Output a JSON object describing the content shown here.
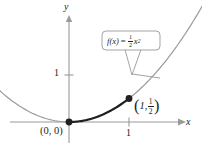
{
  "chart_data": {
    "type": "line",
    "title": "",
    "function_label": "f(x) = ½x²",
    "function_parts": {
      "name": "f",
      "arg": "(x)",
      "equals": "=",
      "coefficient_numerator": "1",
      "coefficient_denominator": "2",
      "variable": "x",
      "exponent": "2"
    },
    "xlabel": "x",
    "ylabel": "y",
    "grid": false,
    "legend": "none",
    "xlim": [
      -2.1,
      3.0
    ],
    "ylim": [
      -0.45,
      2.4
    ],
    "x_ticks": [
      1
    ],
    "x_tick_labels": [
      "1"
    ],
    "y_ticks": [
      1
    ],
    "y_tick_labels": [
      "1"
    ],
    "series": [
      {
        "name": "f(x) = 1/2 x^2 (light)",
        "color": "#9a9a9a",
        "style": "thin",
        "x": [
          -2.0,
          -1.75,
          -1.5,
          -1.25,
          -1.0,
          -0.75,
          -0.5,
          -0.25,
          0.0,
          0.25,
          0.5,
          0.75,
          1.0,
          1.25,
          1.5,
          1.75,
          2.0,
          2.15
        ],
        "y": [
          2.0,
          1.531,
          1.125,
          0.781,
          0.5,
          0.281,
          0.125,
          0.031,
          0.0,
          0.031,
          0.125,
          0.281,
          0.5,
          0.781,
          1.125,
          1.531,
          2.0,
          2.311
        ]
      },
      {
        "name": "highlighted arc 0 to 1 (bold)",
        "color": "#231f20",
        "style": "bold",
        "x": [
          0.0,
          0.2,
          0.4,
          0.6,
          0.8,
          1.0
        ],
        "y": [
          0.0,
          0.02,
          0.08,
          0.18,
          0.32,
          0.5
        ]
      }
    ],
    "points": [
      {
        "name": "origin",
        "x": 0,
        "y": 0,
        "label": "(0, 0)",
        "marker": "filled-circle"
      },
      {
        "name": "endpoint",
        "x": 1,
        "y": 0.5,
        "label": "(1, ½)",
        "marker": "filled-circle",
        "label_parts": {
          "open": "(",
          "x_value": "1",
          "comma": ",",
          "y_numerator": "1",
          "y_denominator": "2",
          "close": ")"
        }
      }
    ],
    "annotations": [
      {
        "name": "function-callout",
        "text": "f(x) = ½x²",
        "shape": "rounded-rect-with-pointer",
        "points_to": "curve"
      }
    ],
    "colors": {
      "curve_light": "#9a9a9a",
      "curve_bold": "#231f20",
      "axis": "#9a9a9a",
      "text": "#231f20",
      "callout_border": "#9a9a9a",
      "background": "#ffffff"
    }
  }
}
